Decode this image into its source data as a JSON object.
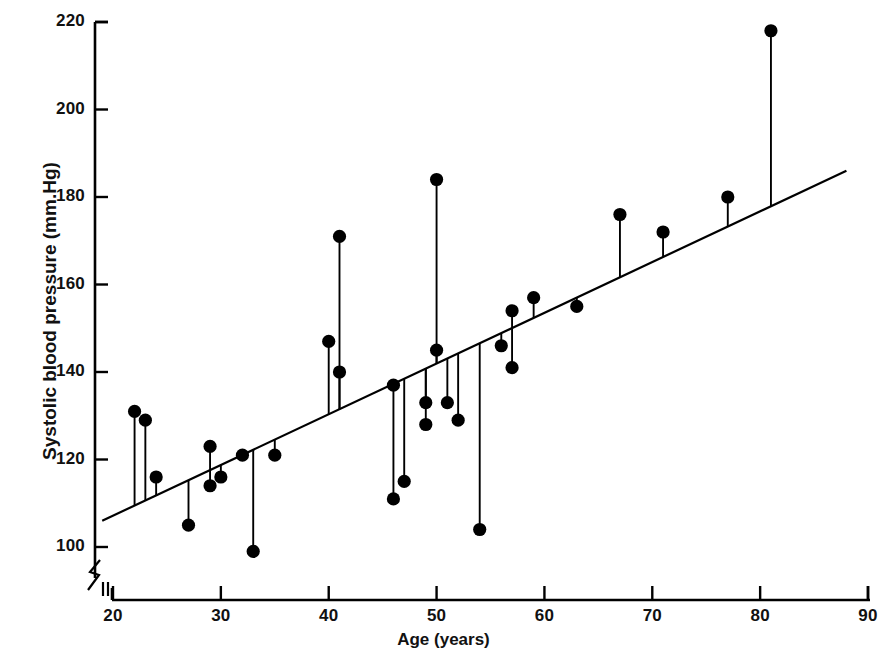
{
  "chart_data": {
    "type": "scatter",
    "title": "",
    "xlabel": "Age (years)",
    "ylabel": "Systolic blood pressure (mm.Hg)",
    "xlim": [
      19,
      90
    ],
    "ylim": [
      96,
      222
    ],
    "xticks": [
      20,
      30,
      40,
      50,
      60,
      70,
      80,
      90
    ],
    "yticks": [
      100,
      120,
      140,
      160,
      180,
      200,
      220
    ],
    "grid": false,
    "legend": "none",
    "axis_break_x": true,
    "axis_break_y": true,
    "series": [
      {
        "name": "Observations",
        "marker": "filled-circle",
        "dropline_to": "regression-line",
        "points": [
          {
            "x": 22,
            "y": 131
          },
          {
            "x": 23,
            "y": 129
          },
          {
            "x": 24,
            "y": 116
          },
          {
            "x": 27,
            "y": 105
          },
          {
            "x": 29,
            "y": 123
          },
          {
            "x": 29,
            "y": 114
          },
          {
            "x": 30,
            "y": 116
          },
          {
            "x": 32,
            "y": 121
          },
          {
            "x": 33,
            "y": 99
          },
          {
            "x": 35,
            "y": 121
          },
          {
            "x": 40,
            "y": 147
          },
          {
            "x": 41,
            "y": 171
          },
          {
            "x": 41,
            "y": 140
          },
          {
            "x": 46,
            "y": 137
          },
          {
            "x": 46,
            "y": 111
          },
          {
            "x": 47,
            "y": 115
          },
          {
            "x": 49,
            "y": 133
          },
          {
            "x": 49,
            "y": 128
          },
          {
            "x": 50,
            "y": 184
          },
          {
            "x": 50,
            "y": 145
          },
          {
            "x": 51,
            "y": 133
          },
          {
            "x": 52,
            "y": 129
          },
          {
            "x": 54,
            "y": 104
          },
          {
            "x": 56,
            "y": 146
          },
          {
            "x": 57,
            "y": 141
          },
          {
            "x": 57,
            "y": 154
          },
          {
            "x": 59,
            "y": 157
          },
          {
            "x": 63,
            "y": 155
          },
          {
            "x": 67,
            "y": 176
          },
          {
            "x": 71,
            "y": 172
          },
          {
            "x": 77,
            "y": 180
          },
          {
            "x": 81,
            "y": 218
          }
        ]
      }
    ],
    "regression_line": {
      "name": "Fitted regression line",
      "x_start": 19,
      "y_start": 106,
      "x_end": 88,
      "y_end": 186
    }
  },
  "axis": {
    "x_tick_labels": [
      "20",
      "30",
      "40",
      "50",
      "60",
      "70",
      "80",
      "90"
    ],
    "y_tick_labels": [
      "100",
      "120",
      "140",
      "160",
      "180",
      "200",
      "220"
    ]
  }
}
